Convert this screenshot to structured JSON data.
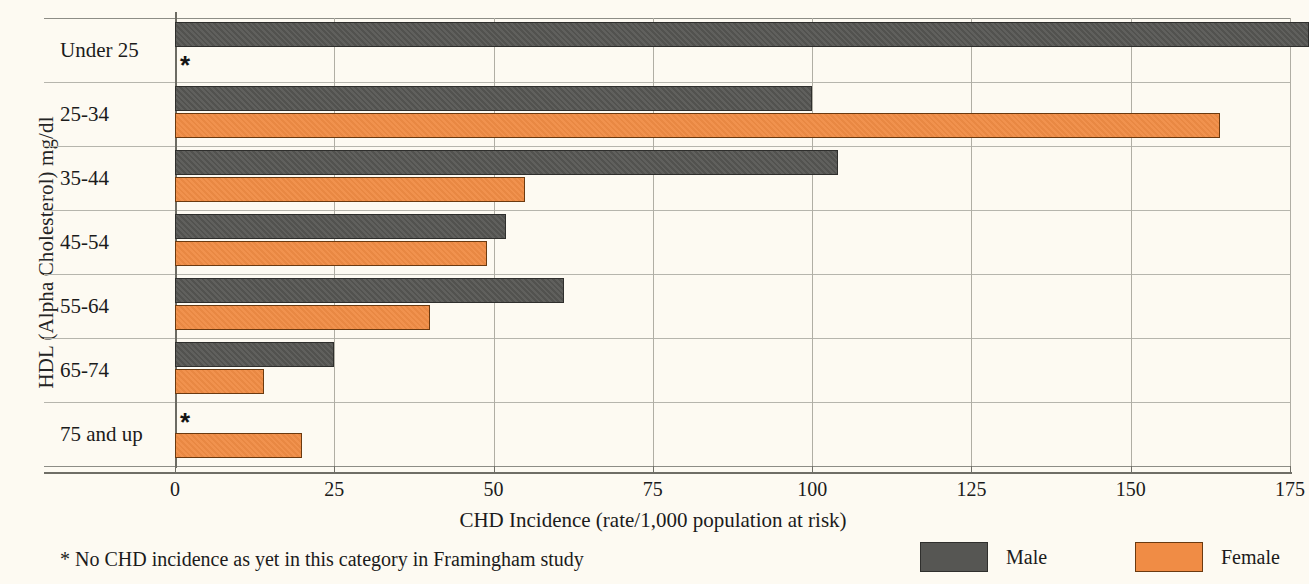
{
  "chart_data": {
    "type": "bar",
    "orientation": "horizontal",
    "title": "",
    "xlabel": "CHD Incidence (rate/1,000 population at risk)",
    "ylabel": "HDL (Alpha Cholesterol) mg/dl",
    "categories": [
      "Under 25",
      "25-34",
      "35-44",
      "45-54",
      "55-64",
      "65-74",
      "75 and up"
    ],
    "series": [
      {
        "name": "Male",
        "color": "#565653",
        "values": [
          178,
          100,
          104,
          52,
          61,
          25,
          null
        ]
      },
      {
        "name": "Female",
        "color": "#f08c45",
        "values": [
          null,
          164,
          55,
          49,
          40,
          14,
          20
        ]
      }
    ],
    "xlim": [
      0,
      175
    ],
    "xticks": [
      0,
      25,
      50,
      75,
      100,
      125,
      150,
      175
    ],
    "xticklabels": [
      "0",
      "25",
      "50",
      "75",
      "100",
      "125",
      "150",
      "175"
    ],
    "grid": "vertical-and-horizontal",
    "legend_position": "bottom-right",
    "annotations": [
      {
        "category": "Under 25",
        "series": "Female",
        "marker": "*"
      },
      {
        "category": "75 and up",
        "series": "Male",
        "marker": "*"
      }
    ],
    "footnote": "* No CHD incidence as yet in this category in Framingham study"
  },
  "legend": {
    "male_label": "Male",
    "female_label": "Female"
  }
}
